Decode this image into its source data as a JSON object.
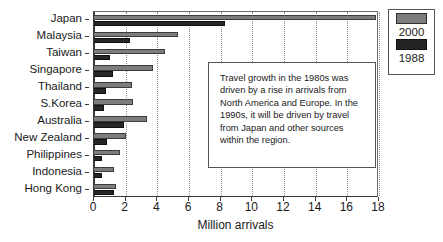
{
  "chart_data": {
    "type": "bar",
    "orientation": "horizontal",
    "title": "",
    "xlabel": "Million arrivals",
    "ylabel": "",
    "xlim": [
      0,
      18
    ],
    "xticks": [
      0,
      2,
      4,
      6,
      8,
      10,
      12,
      14,
      16,
      18
    ],
    "xtick_labels": [
      "0",
      "2",
      "4",
      "6",
      "8",
      "10",
      "12",
      "14",
      "16",
      "18"
    ],
    "grid": "vertical-dotted",
    "legend_position": "top-right",
    "categories": [
      "Japan",
      "Malaysia",
      "Taiwan",
      "Singapore",
      "Thailand",
      "S.Korea",
      "Australia",
      "New Zealand",
      "Philippines",
      "Indonesia",
      "Hong Kong"
    ],
    "series": [
      {
        "name": "2000",
        "color": "#7d7d7d",
        "values": [
          17.8,
          5.3,
          4.5,
          3.7,
          2.4,
          2.45,
          3.35,
          2.0,
          1.65,
          1.25,
          1.4
        ]
      },
      {
        "name": "1988",
        "color": "#262626",
        "values": [
          8.3,
          2.3,
          1.0,
          1.2,
          0.75,
          0.65,
          1.9,
          0.85,
          0.5,
          0.5,
          1.25
        ]
      }
    ],
    "annotations": [
      {
        "text": "Travel growth in the 1980s was driven by a rise in arrivals from North America and Europe.  In the 1990s, it will be driven by travel from Japan and other sources within the region."
      }
    ]
  },
  "legend": {
    "items": [
      {
        "label": "2000",
        "swatch": "legend-swatch-2000"
      },
      {
        "label": "1988",
        "swatch": "legend-swatch-1988"
      }
    ]
  },
  "annotation": {
    "body": "Travel growth in the 1980s was driven by a rise in arrivals from North America and Europe.  In the 1990s, it will be driven by travel from Japan and other sources within the region."
  },
  "axis": {
    "x_title": "Million arrivals"
  }
}
